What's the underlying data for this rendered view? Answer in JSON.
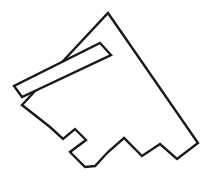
{
  "figure": {
    "background_color": "#ffffff",
    "stroke_color": "#1a1a1a",
    "stroke_width": 2.4,
    "canvas": {
      "width": 212,
      "height": 186
    },
    "outer_outline": {
      "name": "outer-polygon",
      "closed": true,
      "points": [
        [
          108,
          13
        ],
        [
          198,
          143
        ],
        [
          177,
          159
        ],
        [
          160,
          144
        ],
        [
          142,
          156
        ],
        [
          124,
          138
        ],
        [
          108,
          152
        ],
        [
          95,
          166
        ],
        [
          85,
          167
        ],
        [
          70,
          152
        ],
        [
          86,
          140
        ],
        [
          75,
          129
        ],
        [
          63,
          139
        ],
        [
          50,
          127
        ],
        [
          22,
          105
        ],
        [
          22,
          104
        ]
      ],
      "points_string": "108,13 198,143 177,159 160,144 142,156 124,138 108,152 95,166 85,167 70,152 86,140 75,129 63,139 50,127 22,105"
    },
    "inner_slot": {
      "name": "inner-slot-parallelogram",
      "closed": true,
      "points": [
        [
          100,
          43
        ],
        [
          111,
          55
        ],
        [
          22,
          97
        ],
        [
          14,
          86
        ]
      ],
      "points_string": "100,43 111,55 22,97 14,86"
    }
  }
}
